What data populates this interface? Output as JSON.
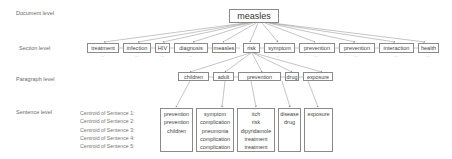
{
  "levels": {
    "document": "Document level",
    "section": "Section level",
    "paragraph": "Paragraph level",
    "sentence": "Sentence level"
  },
  "document_node": "measles",
  "section_nodes": [
    "treatment",
    "infection",
    "HIV",
    "diagnosis",
    "measles",
    "risk",
    "symptom",
    "prevention",
    "prevention",
    "interaction",
    "health"
  ],
  "section_ellipsis": "...",
  "paragraph_nodes": [
    "children",
    "adult",
    "prevention",
    "drug",
    "exposure"
  ],
  "centroid_labels": [
    "Centroid of Sentence 1:",
    "Centroid of Sentence 2:",
    "Centroid of Sentence 3:",
    "Centroid of Sentence 4:",
    "Centroid of Sentence 5:"
  ],
  "sentence_nodes": [
    {
      "lines": [
        "prevention",
        "prevention",
        "children"
      ]
    },
    {
      "lines": [
        "symptom",
        "complication",
        "pneumonia",
        "complication",
        "complication"
      ]
    },
    {
      "lines": [
        "itch",
        "risk",
        "dipyridamole",
        "treatment",
        "treatment"
      ]
    },
    {
      "lines": [
        "disease",
        "drug"
      ]
    },
    {
      "lines": [
        "exposure"
      ]
    }
  ]
}
